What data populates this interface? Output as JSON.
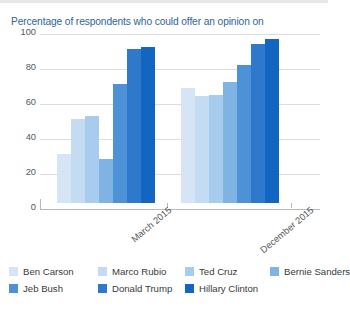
{
  "chart_data": {
    "type": "bar",
    "title": "Percentage of respondents who could offer an opinion on",
    "xlabel": "",
    "ylabel": "",
    "ylim": [
      0,
      100
    ],
    "yticks": [
      0,
      20,
      40,
      60,
      80,
      100
    ],
    "grid": true,
    "legend_position": "bottom",
    "categories": [
      "March 2015",
      "December 2015"
    ],
    "series": [
      {
        "name": "Ben Carson",
        "color": "#d6e5f5",
        "values": [
          28,
          66
        ]
      },
      {
        "name": "Marco Rubio",
        "color": "#c3dcf1",
        "values": [
          48,
          61
        ]
      },
      {
        "name": "Ted Cruz",
        "color": "#a8cced",
        "values": [
          50,
          62
        ]
      },
      {
        "name": "Bernie Sanders",
        "color": "#7eb3e3",
        "values": [
          25,
          69
        ]
      },
      {
        "name": "Jeb Bush",
        "color": "#4d91d6",
        "values": [
          68,
          79
        ]
      },
      {
        "name": "Donald Trump",
        "color": "#2f79cc",
        "values": [
          88,
          91
        ]
      },
      {
        "name": "Hillary Clinton",
        "color": "#1265c0",
        "values": [
          89,
          94
        ]
      }
    ]
  },
  "axis": {
    "tick_labels": [
      "100",
      "80",
      "60",
      "40",
      "20",
      "0"
    ]
  },
  "legend": {
    "rows": [
      [
        {
          "label": "Ben Carson",
          "color": "#d6e5f5"
        },
        {
          "label": "Marco Rubio",
          "color": "#c3dcf1"
        },
        {
          "label": "Ted Cruz",
          "color": "#a8cced"
        },
        {
          "label": "Bernie Sanders",
          "color": "#7eb3e3"
        }
      ],
      [
        {
          "label": "Jeb Bush",
          "color": "#4d91d6"
        },
        {
          "label": "Donald Trump",
          "color": "#2f79cc"
        },
        {
          "label": "Hillary Clinton",
          "color": "#1265c0"
        }
      ]
    ]
  },
  "theme": {
    "title_color": "#31639c",
    "grid_color": "#dcdcdc",
    "axis_color": "#b9b9b9",
    "tick_text_color": "#58585a",
    "legend_text_color": "#3a3a3c"
  }
}
